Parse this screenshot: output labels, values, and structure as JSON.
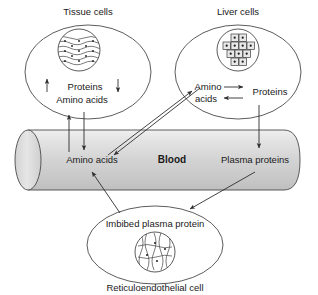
{
  "diagram": {
    "canvas": {
      "width": 318,
      "height": 295
    },
    "colors": {
      "stroke": "#3a3a3a",
      "text": "#1a1a1a",
      "vessel_fill_light": "#f2f2f2",
      "vessel_fill_mid": "#d9d9d9",
      "vessel_fill_dark": "#c4c4c4",
      "square_fill": "#e8e8e8"
    },
    "labels": {
      "tissue_cells": "Tissue cells",
      "liver_cells": "Liver cells",
      "reticuloendothelial_cell": "Reticuloendothelial cell",
      "blood": "Blood"
    },
    "tissue_cell": {
      "name": "Tissue cells",
      "contents": [
        "Proteins",
        "Amino acids"
      ],
      "proteins": "Proteins",
      "amino_acids": "Amino acids",
      "up_arrow": "↑",
      "down_arrow": "↓"
    },
    "liver_cell": {
      "name": "Liver cells",
      "amino_acids_line1": "Amino",
      "amino_acids_line2": "acids",
      "proteins": "Proteins",
      "forward_arrow": "→",
      "back_arrow": "←"
    },
    "blood_vessel": {
      "label": "Blood",
      "left_item": "Amino acids",
      "right_item": "Plasma proteins"
    },
    "reticulo_cell": {
      "name": "Reticuloendothelial cell",
      "inner_label": "Imbibed plasma protein"
    },
    "flows": [
      {
        "id": "blood-to-tissue",
        "from": "Blood amino acids",
        "to": "Tissue cells",
        "direction": "up"
      },
      {
        "id": "tissue-to-blood",
        "from": "Tissue cells",
        "to": "Blood amino acids",
        "direction": "down"
      },
      {
        "id": "blood-to-liver",
        "from": "Blood amino acids",
        "to": "Liver amino acids",
        "direction": "up-right"
      },
      {
        "id": "liver-to-blood",
        "from": "Liver amino acids",
        "to": "Blood",
        "direction": "down-left"
      },
      {
        "id": "liver-proteins-to-plasma",
        "from": "Liver proteins",
        "to": "Plasma proteins",
        "direction": "down"
      },
      {
        "id": "plasma-to-reticulo",
        "from": "Plasma proteins",
        "to": "Reticuloendothelial cell",
        "direction": "down-left"
      },
      {
        "id": "reticulo-to-blood",
        "from": "Reticuloendothelial cell",
        "to": "Blood amino acids",
        "direction": "up-right"
      },
      {
        "id": "liver-aa-to-proteins",
        "from": "Amino acids",
        "to": "Proteins",
        "direction": "right"
      },
      {
        "id": "liver-proteins-to-aa",
        "from": "Proteins",
        "to": "Amino acids",
        "direction": "left"
      }
    ]
  }
}
